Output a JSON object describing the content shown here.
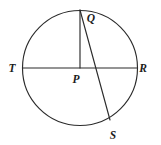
{
  "figure": {
    "background_color": "#ffffff",
    "stroke_color": "#2b2b2b",
    "label_color": "#1c1c1c",
    "width": 161,
    "height": 145
  },
  "circle": {
    "center_x": 80,
    "center_y": 68,
    "radius": 57.5
  },
  "points": [
    {
      "id": "Q",
      "label": "Q",
      "x": 80,
      "y": 10,
      "label_x": 91,
      "label_y": 22
    },
    {
      "id": "T",
      "label": "T",
      "x": 22.5,
      "y": 68,
      "label_x": 12,
      "label_y": 72
    },
    {
      "id": "R",
      "label": "R",
      "x": 137.5,
      "y": 68,
      "label_x": 143,
      "label_y": 72
    },
    {
      "id": "P",
      "label": "P",
      "x": 80,
      "y": 68,
      "label_x": 76,
      "label_y": 83
    },
    {
      "id": "S",
      "label": "S",
      "x": 110,
      "y": 120,
      "label_x": 113,
      "label_y": 139
    }
  ],
  "segments": [
    {
      "id": "diameter-TR",
      "name": "T-R diameter",
      "x1": 22.5,
      "y1": 68,
      "x2": 137.5,
      "y2": 68
    },
    {
      "id": "radius-PQ",
      "name": "P-Q radius",
      "x1": 80,
      "y1": 68,
      "x2": 80,
      "y2": 10
    },
    {
      "id": "chord-QS",
      "name": "Q-S chord",
      "x1": 80,
      "y1": 10,
      "x2": 110,
      "y2": 120
    }
  ]
}
